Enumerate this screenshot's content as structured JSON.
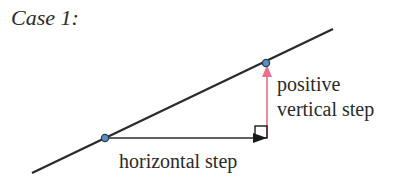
{
  "title": "Case 1:",
  "labels": {
    "vertical_line1": "positive",
    "vertical_line2": "vertical step",
    "horizontal": "horizontal step"
  },
  "colors": {
    "line": "#2b2b2b",
    "vertical_step": "#e8708a",
    "point_fill": "#5b8fc0",
    "point_stroke": "#2a3f5a"
  }
}
